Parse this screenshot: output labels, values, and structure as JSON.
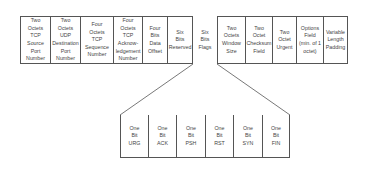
{
  "diagram": {
    "header_fields": [
      {
        "label": "Two\nOctets\nTCP\nSource\nPort\nNumber",
        "x": 20,
        "w": 30
      },
      {
        "label": "Two\nOctets\nUDP\nDestination\nPort\nNumber",
        "x": 50,
        "w": 30
      },
      {
        "label": "Four\nOctets\nTCP\nSequence\nNumber",
        "x": 80,
        "w": 33
      },
      {
        "label": "Four\nOctets\nTCP\nAcknow-\nledgement\nNumber",
        "x": 113,
        "w": 29
      },
      {
        "label": "Four\nBits\nData\nOffset",
        "x": 142,
        "w": 25
      },
      {
        "label": "Six\nBits\nReserved",
        "x": 167,
        "w": 26
      },
      {
        "label": "Six\nBits\nFlags",
        "x": 193,
        "w": 24
      },
      {
        "label": "Two\nOctets\nWindow\nSize",
        "x": 217,
        "w": 28
      },
      {
        "label": "Two\nOctet\nChecksum\nField",
        "x": 245,
        "w": 27
      },
      {
        "label": "Two\nOctet\nUrgent",
        "x": 272,
        "w": 24
      },
      {
        "label": "Options\nField\n(min. of 1\noctet)",
        "x": 296,
        "w": 27
      },
      {
        "label": "Variable\nLength\nPadding",
        "x": 323,
        "w": 25
      }
    ],
    "flag_bits": [
      {
        "label": "One\nBit\nURG",
        "x": 120,
        "w": 28
      },
      {
        "label": "One\nBit\nACK",
        "x": 148,
        "w": 28
      },
      {
        "label": "One\nBit\nPSH",
        "x": 176,
        "w": 29
      },
      {
        "label": "One\nBit\nRST",
        "x": 205,
        "w": 28
      },
      {
        "label": "One\nBit\nSYN",
        "x": 233,
        "w": 29
      },
      {
        "label": "One\nBit\nFIN",
        "x": 262,
        "w": 28
      }
    ],
    "colors": {
      "line": "#555555",
      "text": "#444444",
      "background": "#ffffff"
    }
  }
}
